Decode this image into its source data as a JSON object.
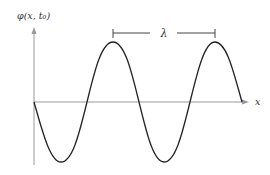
{
  "diagram": {
    "y_axis_label": "φ(x, t₀)",
    "x_axis_label": "x",
    "wavelength_label": "λ",
    "curve": "sine wave, starts at origin going downward, two full periods shown",
    "colors": {
      "curve": "#222222",
      "axis": "#999999",
      "bracket": "#444444"
    }
  }
}
